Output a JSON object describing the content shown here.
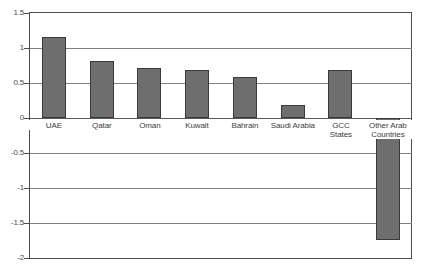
{
  "chart_data": {
    "type": "bar",
    "title": "",
    "subtitle": "",
    "xlabel": "",
    "ylabel": "",
    "categories": [
      "UAE",
      "Qatar",
      "Oman",
      "Kuwait",
      "Bahrain",
      "Saudi Arabia",
      "GCC\nStates",
      "Other Arab\nCountries"
    ],
    "values": [
      1.16,
      0.82,
      0.71,
      0.69,
      0.58,
      0.19,
      0.68,
      -1.74
    ],
    "ylim": [
      -2,
      1.5
    ],
    "yticks": [
      1.5,
      1,
      0.5,
      0,
      -0.5,
      -1,
      -1.5,
      -2
    ],
    "ytick_labels": [
      "1.5",
      "1",
      "0.5",
      "0",
      "-0.5",
      "-1",
      "-1.5",
      "-2"
    ],
    "grid": true,
    "legend": "none",
    "series": [
      {
        "name": "series-1",
        "values": [
          1.16,
          0.82,
          0.71,
          0.69,
          0.58,
          0.19,
          0.68,
          -1.74
        ]
      }
    ],
    "colors": {
      "bar_fill": "#6e6e6e",
      "bar_border": "#3a3a3a",
      "gridline": "#808080",
      "axis": "#4d4d4d",
      "text": "#3d3d3d",
      "background": "#ffffff"
    }
  }
}
